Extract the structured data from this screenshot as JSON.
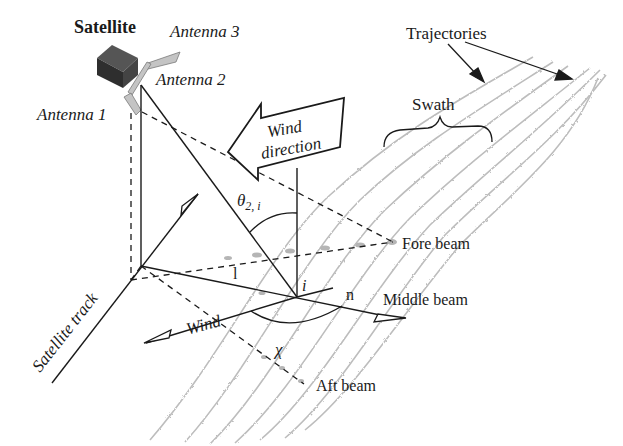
{
  "diagram": {
    "labels": {
      "satellite": "Satellite",
      "antenna1": "Antenna 1",
      "antenna2": "Antenna 2",
      "antenna3": "Antenna 3",
      "trajectories": "Trajectories",
      "swath": "Swath",
      "wind_direction_line1": "Wind",
      "wind_direction_line2": "direction",
      "theta": "θ",
      "theta_sub": "2, i",
      "fore_beam": "Fore beam",
      "middle_beam": "Middle beam",
      "aft_beam": "Aft beam",
      "point_i": "i",
      "normal_n": "n",
      "unit_l": "l",
      "chi": "χ",
      "wind": "Wind",
      "satellite_track": "Satellite track"
    },
    "colors": {
      "line": "#1a1a1a",
      "trajectory": "#b8b8b8",
      "satellite_body": "#3a3a3a",
      "antenna_panel": "#bdbdbd"
    },
    "trajectory_count": 7
  }
}
